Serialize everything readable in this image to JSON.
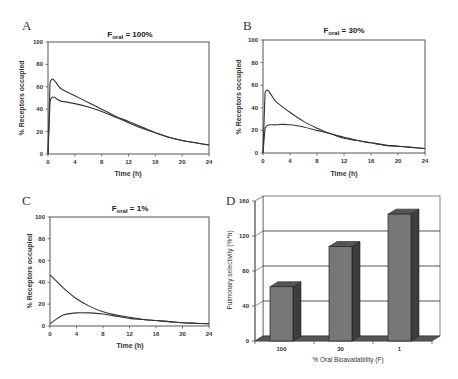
{
  "figure": {
    "panels": [
      {
        "letter": "A",
        "title_main": "F",
        "title_sub": "oral",
        "title_rest": " = 100%",
        "xlabel": "Time (h)",
        "ylabel": "% Receptors occupied"
      },
      {
        "letter": "B",
        "title_main": "F",
        "title_sub": "oral",
        "title_rest": " = 30%",
        "xlabel": "Time (h)",
        "ylabel": "% Receptors occupied"
      },
      {
        "letter": "C",
        "title_main": "F",
        "title_sub": "oral",
        "title_rest": " = 1%",
        "xlabel": "Time (h)",
        "ylabel": "% Receptors occupied"
      },
      {
        "letter": "D",
        "xlabel": "% Oral Bioavailability (F)",
        "ylabel": "Pulmonary selectivity (%*h)"
      }
    ],
    "x_ticks": [
      "0",
      "4",
      "8",
      "12",
      "16",
      "20",
      "24"
    ],
    "y_ticks": [
      "0",
      "20",
      "40",
      "60",
      "80",
      "100"
    ],
    "d_y_ticks": [
      "0",
      "40",
      "80",
      "120",
      "160"
    ],
    "d_categories": [
      "100",
      "30",
      "1"
    ]
  },
  "chart_data": [
    {
      "type": "line",
      "title": "F_oral = 100%",
      "xlabel": "Time (h)",
      "ylabel": "% Receptors occupied",
      "xlim": [
        0,
        24
      ],
      "ylim": [
        0,
        100
      ],
      "grid": false,
      "x": [
        0,
        0.3,
        2,
        4,
        6,
        8,
        10,
        12,
        14,
        16,
        18,
        20,
        22,
        24
      ],
      "series": [
        {
          "name": "upper curve",
          "values": [
            0,
            63,
            58,
            52,
            46,
            40,
            34,
            29,
            24,
            19,
            15,
            12,
            10,
            8
          ]
        },
        {
          "name": "lower curve",
          "values": [
            0,
            47,
            47,
            45,
            42,
            38,
            33,
            28,
            23,
            19,
            15,
            12,
            10,
            8
          ]
        }
      ]
    },
    {
      "type": "line",
      "title": "F_oral = 30%",
      "xlabel": "Time (h)",
      "ylabel": "% Receptors occupied",
      "xlim": [
        0,
        24
      ],
      "ylim": [
        0,
        100
      ],
      "grid": false,
      "x": [
        0,
        0.3,
        2,
        4,
        6,
        8,
        10,
        12,
        14,
        16,
        18,
        20,
        22,
        24
      ],
      "series": [
        {
          "name": "upper curve",
          "values": [
            0,
            53,
            45,
            36,
            28,
            22,
            17,
            14,
            11,
            9,
            7,
            6,
            5,
            4
          ]
        },
        {
          "name": "lower curve",
          "values": [
            0,
            22,
            25,
            25,
            23,
            20,
            17,
            13,
            11,
            9,
            7,
            6,
            5,
            4
          ]
        }
      ]
    },
    {
      "type": "line",
      "title": "F_oral = 1%",
      "xlabel": "Time (h)",
      "ylabel": "% Receptors occupied",
      "xlim": [
        0,
        24
      ],
      "ylim": [
        0,
        100
      ],
      "grid": false,
      "x": [
        0,
        2,
        4,
        6,
        8,
        10,
        12,
        14,
        16,
        18,
        20,
        22,
        24
      ],
      "series": [
        {
          "name": "upper curve",
          "values": [
            47,
            35,
            25,
            18,
            13,
            10,
            8,
            6,
            5,
            4,
            3,
            2.5,
            2
          ]
        },
        {
          "name": "lower curve",
          "values": [
            2,
            10,
            12,
            12,
            11,
            9,
            7,
            6,
            5,
            4,
            3,
            2.5,
            2
          ]
        }
      ]
    },
    {
      "type": "bar",
      "title": "",
      "xlabel": "% Oral Bioavailability (F)",
      "ylabel": "Pulmonary selectivity (%*h)",
      "categories": [
        "100",
        "30",
        "1"
      ],
      "values": [
        62,
        108,
        145
      ],
      "ylim": [
        0,
        160
      ],
      "grid": true,
      "style": "3d"
    }
  ]
}
